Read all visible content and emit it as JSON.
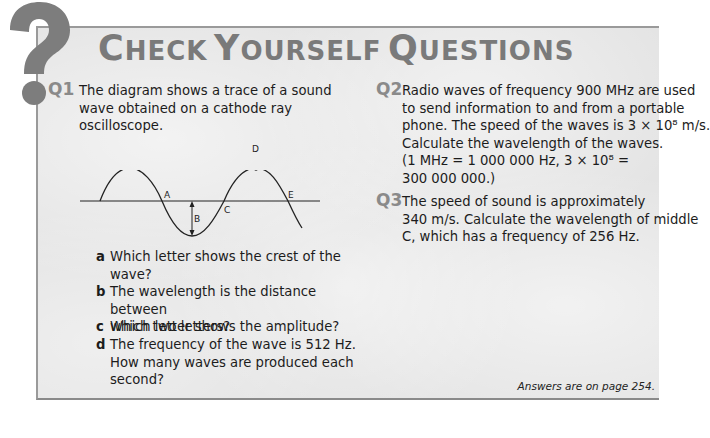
{
  "header": {
    "title_words": [
      {
        "initial": "C",
        "rest": "HECK"
      },
      {
        "initial": "Y",
        "rest": "OURSELF"
      },
      {
        "initial": "Q",
        "rest": "UESTIONS"
      }
    ],
    "icon": "question-mark-icon"
  },
  "questions": [
    {
      "number": "Q1",
      "lines": [
        "The diagram shows a trace of a sound",
        "wave obtained on a cathode ray",
        "oscilloscope."
      ],
      "diagram": {
        "type": "sine-wave",
        "labels": [
          "A",
          "B",
          "C",
          "D",
          "E"
        ]
      },
      "parts": [
        {
          "letter": "a",
          "lines": [
            "Which letter shows the crest of the",
            "wave?"
          ]
        },
        {
          "letter": "b",
          "lines": [
            "The wavelength is the distance between",
            "which two letters?"
          ]
        },
        {
          "letter": "c",
          "lines": [
            "Which letter shows the amplitude?"
          ]
        },
        {
          "letter": "d",
          "lines": [
            "The frequency of the wave is 512 Hz.",
            "How many waves are produced each",
            "second?"
          ]
        }
      ]
    },
    {
      "number": "Q2",
      "lines": [
        "Radio waves of frequency 900 MHz are used",
        "to send information to and from a portable",
        "phone. The speed of the waves is 3 × 10⁸ m/s.",
        "Calculate the wavelength of the waves.",
        "(1 MHz = 1 000 000 Hz, 3 × 10⁸ =",
        "300 000 000.)"
      ]
    },
    {
      "number": "Q3",
      "lines": [
        "The speed of sound is approximately",
        "340 m/s. Calculate the wavelength of middle",
        "C, which has a frequency of 256 Hz."
      ]
    }
  ],
  "footer": {
    "answers_note": "Answers are on page 254."
  },
  "colors": {
    "panel_bg": "#e4e4e4",
    "title": "#7a7a7a",
    "question_number": "#8a8a8a",
    "icon": "#7d7d7d",
    "text": "#1c1c1c"
  }
}
